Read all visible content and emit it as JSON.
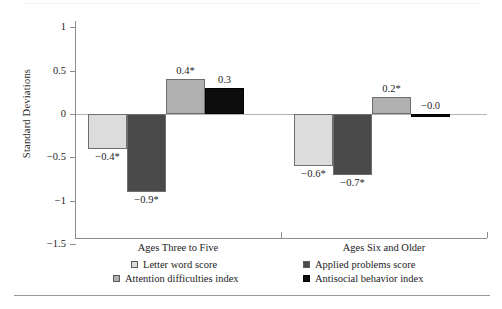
{
  "chart_data": {
    "type": "bar",
    "title": "",
    "subtitle": "",
    "xlabel": "",
    "ylabel": "Standard Deviations",
    "ylim": [
      -1.5,
      1
    ],
    "yticks": [
      "1",
      "0.5",
      "0",
      "−0.5",
      "−1",
      "−1.5"
    ],
    "ytick_values": [
      1,
      0.5,
      0,
      -0.5,
      -1,
      -1.5
    ],
    "grid": false,
    "legend_position": "bottom",
    "categories": [
      "Ages Three to Five",
      "Ages Six and Older"
    ],
    "series": [
      {
        "name": "Letter word score",
        "color": "#dcdcdc",
        "values": [
          -0.4,
          -0.6
        ],
        "labels": [
          "−0.4*",
          "−0.6*"
        ]
      },
      {
        "name": "Applied problems score",
        "color": "#4a4a4a",
        "values": [
          -0.9,
          -0.7
        ],
        "labels": [
          "−0.9*",
          "−0.7*"
        ]
      },
      {
        "name": "Attention difficulties index",
        "color": "#b0b0b0",
        "values": [
          0.4,
          0.2
        ],
        "labels": [
          "0.4*",
          "0.2*"
        ]
      },
      {
        "name": "Antisocial behavior index",
        "color": "#0d0d0d",
        "values": [
          0.3,
          -0.0
        ],
        "labels": [
          "0.3",
          "−0.0"
        ]
      }
    ],
    "note": "Asterisk denotes statistical significance"
  },
  "axis": {
    "y_title": "Standard Deviations",
    "ticks": [
      {
        "label": "1"
      },
      {
        "label": "0.5"
      },
      {
        "label": "0"
      },
      {
        "label": "−0.5"
      },
      {
        "label": "−1"
      },
      {
        "label": "−1.5"
      }
    ]
  },
  "groups": [
    {
      "label": "Ages Three to Five",
      "bars": [
        {
          "series": "Letter word score",
          "label": "−0.4*"
        },
        {
          "series": "Applied problems score",
          "label": "−0.9*"
        },
        {
          "series": "Attention difficulties index",
          "label": "0.4*"
        },
        {
          "series": "Antisocial behavior index",
          "label": "0.3"
        }
      ]
    },
    {
      "label": "Ages Six and Older",
      "bars": [
        {
          "series": "Letter word score",
          "label": "−0.6*"
        },
        {
          "series": "Applied problems score",
          "label": "−0.7*"
        },
        {
          "series": "Attention difficulties index",
          "label": "0.2*"
        },
        {
          "series": "Antisocial behavior index",
          "label": "−0.0"
        }
      ]
    }
  ],
  "legend": {
    "items": [
      {
        "label": "Letter word score",
        "color": "#dcdcdc"
      },
      {
        "label": "Applied problems score",
        "color": "#4a4a4a"
      },
      {
        "label": "Attention difficulties index",
        "color": "#b0b0b0"
      },
      {
        "label": "Antisocial behavior index",
        "color": "#0d0d0d"
      }
    ]
  }
}
